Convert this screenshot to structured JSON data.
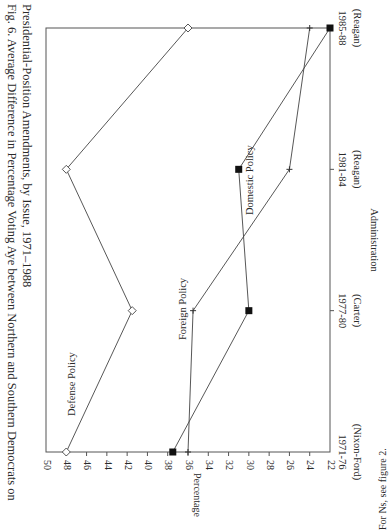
{
  "caption": {
    "line1": "Fig. 6. Average Difference in Percentage Voting Aye between Northern and Southern Democrats on",
    "line2": "Presidential-Position Amendments, by Issue, 1971–1988"
  },
  "footnote": "For Ns, see figure 2.",
  "chart_data": {
    "type": "line",
    "title": "Average Difference in Percentage Voting Aye between Northern and Southern Democrats on Presidential-Position Amendments, by Issue, 1971–1988",
    "xlabel": "Administration",
    "ylabel": "Percentage",
    "categories": [
      "1971-76 (Nixon-Ford)",
      "1977-80 (Carter)",
      "1981-84 (Reagan)",
      "1985-88 (Reagan)"
    ],
    "category_lines": [
      [
        "1971-76",
        "(Nixon-Ford)"
      ],
      [
        "1977-80",
        "(Carter)"
      ],
      [
        "1981-84",
        "(Reagan)"
      ],
      [
        "1985-88",
        "(Reagan)"
      ]
    ],
    "ylim": [
      22,
      50
    ],
    "yticks": [
      50,
      48,
      46,
      44,
      42,
      40,
      38,
      36,
      34,
      32,
      30,
      28,
      26,
      24,
      22
    ],
    "grid": false,
    "orientation": "rotated 90° clockwise",
    "series": [
      {
        "name": "Defense Policy",
        "marker": "diamond-open",
        "values": [
          48,
          41.5,
          48,
          36
        ]
      },
      {
        "name": "Foreign Policy",
        "marker": "plus",
        "values": [
          36,
          35.5,
          26,
          24
        ]
      },
      {
        "name": "Domestic Policy",
        "marker": "square-filled",
        "values": [
          37.5,
          30,
          31,
          22
        ]
      }
    ]
  }
}
